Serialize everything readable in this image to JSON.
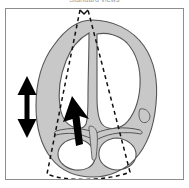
{
  "figure": {
    "caption": "Standard views",
    "type": "echocardiography-four-chamber-schematic",
    "frame": {
      "border_color": "#8d8d8d",
      "background": "#ffffff",
      "x": 5,
      "y": 8,
      "width": 179,
      "height": 172
    }
  },
  "colors": {
    "myocardium_fill": "#c8c8c8",
    "myocardium_stroke": "#555555",
    "chamber_fill": "#ffffff",
    "scan_cone_stroke": "#111111",
    "arrow_fill": "#000000",
    "caption_text": "#9a9a9a",
    "frame_border": "#8d8d8d"
  },
  "elements": {
    "heart_outline": {
      "label": "heart myocardium outline",
      "fill": "#c8c8c8",
      "stroke": "#555555"
    },
    "left_ventricle": {
      "label": "left ventricle chamber"
    },
    "right_ventricle": {
      "label": "right ventricle chamber"
    },
    "left_atrium": {
      "label": "left atrium chamber"
    },
    "right_atrium": {
      "label": "right atrium chamber"
    },
    "interventricular_septum": {
      "label": "interventricular septum"
    },
    "scan_cone": {
      "label": "ultrasound scan sector",
      "style": "dashed",
      "apex_x": 80,
      "apex_y": 10
    },
    "motion_arrow": {
      "label": "double-headed vertical motion arrow",
      "direction": "vertical-bidirectional",
      "x": 27,
      "y_top": 78,
      "y_bottom": 135
    },
    "probe_arrow": {
      "label": "solid black direction arrow",
      "direction": "up-left",
      "tail_x": 82,
      "tail_y": 142,
      "head_x": 68,
      "head_y": 100
    }
  }
}
